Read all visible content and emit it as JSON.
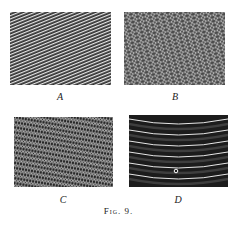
{
  "figure": {
    "caption": "Fig. 9.",
    "panels": [
      {
        "id": "A",
        "label": "A",
        "pattern": "fine parallel diagonal lines"
      },
      {
        "id": "B",
        "label": "B",
        "pattern": "cross-hatched diamond mesh"
      },
      {
        "id": "C",
        "label": "C",
        "pattern": "dense fine diamond lattice"
      },
      {
        "id": "D",
        "label": "D",
        "pattern": "concentric curved bands with small circle"
      }
    ]
  }
}
